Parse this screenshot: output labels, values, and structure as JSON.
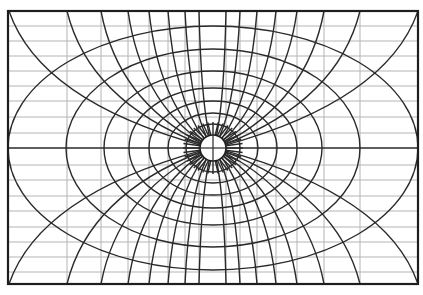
{
  "diagram": {
    "type": "orthogonal curvilinear coordinate grid",
    "frame": {
      "x": 8,
      "y": 11,
      "width": 410,
      "height": 273
    },
    "center": {
      "x": 213,
      "y": 148
    },
    "center_circle_radius": 13,
    "colors": {
      "frame": "#1e1e1e",
      "curves": "#2a2a2a",
      "grid": "#b4b4b4",
      "background": "#ffffff"
    },
    "thin_horizontal_y": [
      26,
      41,
      56,
      71,
      86,
      101,
      117,
      133,
      165,
      180,
      196,
      211,
      227,
      242,
      257,
      272
    ],
    "thin_vertical_x": [
      67,
      101,
      128,
      149,
      168,
      185,
      199,
      226,
      240,
      257,
      276,
      297,
      324,
      360
    ],
    "ellipses": [
      {
        "rx": 27,
        "ry": 24
      },
      {
        "rx": 45,
        "ry": 35
      },
      {
        "rx": 64,
        "ry": 47
      },
      {
        "rx": 84,
        "ry": 60
      },
      {
        "rx": 109,
        "ry": 77
      },
      {
        "rx": 147,
        "ry": 99
      },
      {
        "rx": 205,
        "ry": 122
      }
    ],
    "ray_edge_x": [
      9,
      67,
      101,
      128,
      149,
      168,
      185,
      199,
      226,
      240,
      257,
      276,
      297,
      324,
      360,
      418
    ]
  }
}
